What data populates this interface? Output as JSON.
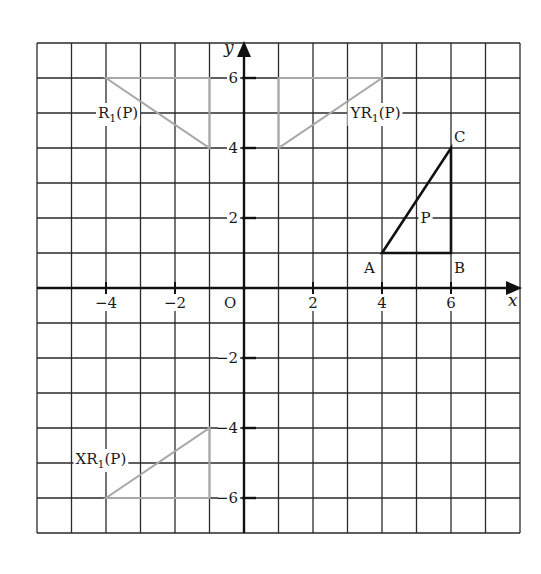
{
  "diagram": {
    "type": "coordinate-grid-transformations",
    "axes": {
      "x_label": "x",
      "y_label": "y",
      "origin_label": "O",
      "x_range": [
        -6,
        8
      ],
      "y_range": [
        -7,
        7
      ],
      "grid_step": 1,
      "x_ticks": [
        {
          "value": -4,
          "label": "−4"
        },
        {
          "value": -2,
          "label": "−2"
        },
        {
          "value": 2,
          "label": "2"
        },
        {
          "value": 4,
          "label": "4"
        },
        {
          "value": 6,
          "label": "6"
        }
      ],
      "y_ticks": [
        {
          "value": 6,
          "label": "6"
        },
        {
          "value": 4,
          "label": "4"
        },
        {
          "value": 2,
          "label": "2"
        },
        {
          "value": -2,
          "label": "−2"
        },
        {
          "value": -4,
          "label": "−4"
        },
        {
          "value": -6,
          "label": "−6"
        }
      ]
    },
    "shapes": [
      {
        "name": "P",
        "label": "P",
        "color": "#111111",
        "vertices": [
          [
            4,
            1
          ],
          [
            6,
            1
          ],
          [
            6,
            4
          ]
        ],
        "vertex_labels": [
          "A",
          "B",
          "C"
        ]
      },
      {
        "name": "R1(P)",
        "label_main": "R",
        "label_sub": "1",
        "label_tail": "(P)",
        "color": "#a8a8a8",
        "vertices": [
          [
            -4,
            6
          ],
          [
            -1,
            6
          ],
          [
            -1,
            4
          ]
        ]
      },
      {
        "name": "YR1(P)",
        "label_main": "YR",
        "label_sub": "1",
        "label_tail": "(P)",
        "color": "#a8a8a8",
        "vertices": [
          [
            1,
            4
          ],
          [
            1,
            6
          ],
          [
            4,
            6
          ]
        ]
      },
      {
        "name": "XR1(P)",
        "label_main": "XR",
        "label_sub": "1",
        "label_tail": "(P)",
        "color": "#a8a8a8",
        "vertices": [
          [
            -4,
            -6
          ],
          [
            -1,
            -6
          ],
          [
            -1,
            -4
          ]
        ]
      }
    ]
  }
}
